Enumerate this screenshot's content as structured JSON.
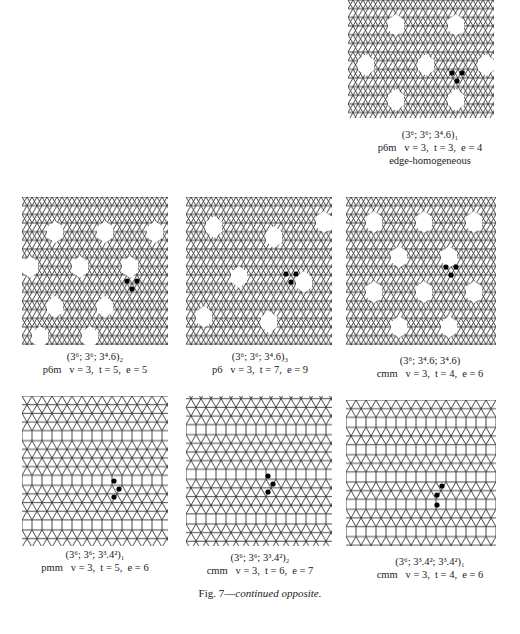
{
  "figure": {
    "caption_prefix": "Fig. 7—",
    "caption_italic": "continued opposite."
  },
  "panels": [
    {
      "id": "p1",
      "name": "(3⁶; 3⁶; 3⁴.6)₁",
      "group": "p6m",
      "params": "v = 3,  t = 3,  e = 4",
      "extra": "edge-homogeneous"
    },
    {
      "id": "p2",
      "name": "(3⁶; 3⁶; 3⁴.6)₂",
      "group": "p6m",
      "params": "v = 3,  t = 5,  e = 5"
    },
    {
      "id": "p3",
      "name": "(3⁶; 3⁶; 3⁴.6)₃",
      "group": "p6",
      "params": "v = 3,  t = 7,  e = 9"
    },
    {
      "id": "p4",
      "name": "(3⁶; 3⁴.6; 3⁴.6)",
      "group": "cmm",
      "params": "v = 3,  t = 4,  e = 6"
    },
    {
      "id": "p5",
      "name": "(3⁶; 3⁶; 3³.4²)₁",
      "group": "pmm",
      "params": "v = 3,  t = 5,  e = 6"
    },
    {
      "id": "p6",
      "name": "(3⁶; 3⁶; 3³.4²)₂",
      "group": "cmm",
      "params": "v = 3,  t = 6,  e = 7"
    },
    {
      "id": "p7",
      "name": "(3⁶; 3³.4²; 3³.4²)₁",
      "group": "cmm",
      "params": "v = 3,  t = 4,  e = 6"
    }
  ],
  "colors": {
    "line": "#333333",
    "dot": "#000000",
    "background": "#ffffff"
  }
}
